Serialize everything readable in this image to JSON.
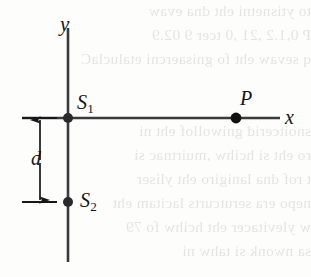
{
  "figure": {
    "kind": "physics-diagram",
    "ink_color": "#17161a",
    "axis_color": "#3a3a3e",
    "paper_color": "#fdfdfb"
  },
  "axes": {
    "y_axis_label": "y",
    "x_axis_label": "x",
    "origin_x": 68,
    "origin_y": 118,
    "y_axis_top": 28,
    "y_axis_bottom": 262,
    "x_axis_left": 22,
    "x_axis_right": 280
  },
  "points": [
    {
      "id": "S1",
      "letter": "S",
      "subscript": "1",
      "x": 68,
      "y": 118,
      "radius": 5.0
    },
    {
      "id": "S2",
      "letter": "S",
      "subscript": "2",
      "x": 68,
      "y": 202,
      "radius": 5.0
    },
    {
      "id": "P",
      "letter": "P",
      "subscript": "",
      "x": 236,
      "y": 118,
      "radius": 5.4
    }
  ],
  "dimension": {
    "label": "d",
    "arrow_x": 40,
    "top_y": 119,
    "bottom_y": 201,
    "extension_line_left": 22,
    "extension_line_right": 57,
    "arrowheads": "both"
  },
  "bleed_through_lines": [
    {
      "top": 2,
      "text": "to ytisnetni eht dna evaw"
    },
    {
      "top": 26,
      "text": "P 0,1.2  ,21  ,0 tcer 9  02.9"
    },
    {
      "top": 50,
      "text": "q sevaw eht fo gnisaercni etaluclaC"
    },
    {
      "top": 122,
      "text": "snoitcerid gniwollof eht ni"
    },
    {
      "top": 146,
      "text": "ro eht si hcihw ,muirtnac si"
    },
    {
      "top": 170,
      "text": "t rof dna lanigiro eht yliser"
    },
    {
      "top": 194,
      "text": "nepo era serutcurts lacitam eht"
    },
    {
      "top": 218,
      "text": "w ylevitacer eht hcihw fo 79"
    },
    {
      "top": 242,
      "text": "sa nwonk si tahw ni"
    }
  ]
}
